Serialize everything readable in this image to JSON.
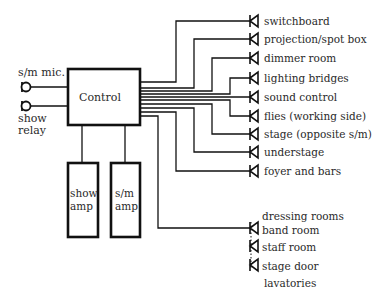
{
  "diagram": {
    "inputs": [
      {
        "id": "sm_mic",
        "label": "s/m mic."
      },
      {
        "id": "show_relay",
        "label_line1": "show",
        "label_line2": "relay"
      }
    ],
    "control": {
      "label": "Control"
    },
    "amps": [
      {
        "id": "show_amp",
        "line1": "show",
        "line2": "amp"
      },
      {
        "id": "sm_amp",
        "line1": "s/m",
        "line2": "amp"
      }
    ],
    "outputs": [
      {
        "label": "switchboard"
      },
      {
        "label": "projection/spot box"
      },
      {
        "label": "dimmer room"
      },
      {
        "label": "lighting bridges"
      },
      {
        "label": "sound control"
      },
      {
        "label": "flies (working side)"
      },
      {
        "label": "stage (opposite s/m)"
      },
      {
        "label": "understage"
      },
      {
        "label": "foyer and bars"
      }
    ],
    "backstage_outputs": [
      {
        "label": "dressing rooms"
      },
      {
        "label": "band room"
      },
      {
        "label": "staff room"
      },
      {
        "label": "stage door"
      },
      {
        "label": "lavatories"
      }
    ]
  }
}
